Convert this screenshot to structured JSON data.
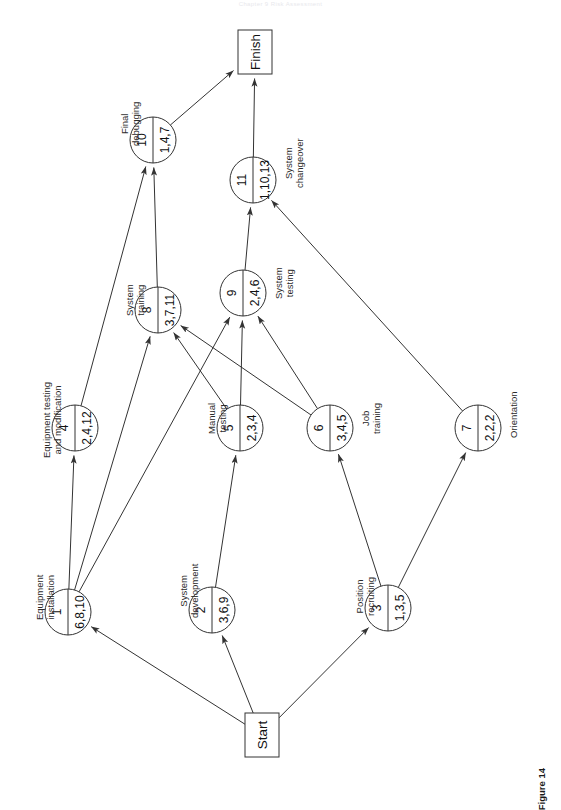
{
  "page": {
    "header_note": "Chapter 9  Risk Assessment",
    "figure_caption": "Figure 14"
  },
  "diagram": {
    "type": "activity-network",
    "orientation": "rotated-90-ccw",
    "terminals": [
      {
        "id": "start",
        "label": "Start",
        "x": 262,
        "y": 735,
        "w": 34,
        "h": 44
      },
      {
        "id": "finish",
        "label": "Finish",
        "x": 255,
        "y": 52,
        "w": 34,
        "h": 44
      }
    ],
    "nodes": [
      {
        "id": 1,
        "num": "1",
        "value": "6,8,10",
        "label": "Equipment\ninstallation",
        "x": 68,
        "y": 612,
        "r": 23,
        "label_dx": -34,
        "label_dy": 8
      },
      {
        "id": 2,
        "num": "2",
        "value": "3,6,9",
        "label": "System\ndevelopment",
        "x": 212,
        "y": 610,
        "r": 23,
        "label_dx": -34,
        "label_dy": 8
      },
      {
        "id": 3,
        "num": "3",
        "value": "1,3,5",
        "label": "Position\nrecruiting",
        "x": 388,
        "y": 608,
        "r": 23,
        "label_dx": -34,
        "label_dy": 8
      },
      {
        "id": 4,
        "num": "4",
        "value": "2,4,12",
        "label": "Equipment testing\nand modification",
        "x": 75,
        "y": 428,
        "r": 23,
        "label_dx": -34,
        "label_dy": 30
      },
      {
        "id": 5,
        "num": "5",
        "value": "2,3,4",
        "label": "Manual\ntesting",
        "x": 240,
        "y": 428,
        "r": 23,
        "label_dx": -34,
        "label_dy": 6
      },
      {
        "id": 6,
        "num": "6",
        "value": "3,4,5",
        "label": "Job\ntraining",
        "x": 330,
        "y": 428,
        "r": 23,
        "label_dx": 30,
        "label_dy": 6
      },
      {
        "id": 7,
        "num": "7",
        "value": "2,2,2",
        "label": "Orientation",
        "x": 478,
        "y": 428,
        "r": 23,
        "label_dx": 30,
        "label_dy": 10
      },
      {
        "id": 8,
        "num": "8",
        "value": "3,7,11",
        "label": "System\ntraining",
        "x": 158,
        "y": 310,
        "r": 23,
        "label_dx": -34,
        "label_dy": 6
      },
      {
        "id": 9,
        "num": "9",
        "value": "2,4,6",
        "label": "System\ntesting",
        "x": 243,
        "y": 293,
        "r": 23,
        "label_dx": 30,
        "label_dy": 6
      },
      {
        "id": 10,
        "num": "10",
        "value": "1,4,7",
        "label": "Final\ndebugging",
        "x": 153,
        "y": 140,
        "r": 23,
        "label_dx": -34,
        "label_dy": 6
      },
      {
        "id": 11,
        "num": "11",
        "value": "1,10,13",
        "label": "System\nchangeover",
        "x": 253,
        "y": 180,
        "r": 23,
        "label_dx": 30,
        "label_dy": 8
      }
    ],
    "edges": [
      {
        "from": "start",
        "to": 1
      },
      {
        "from": "start",
        "to": 2
      },
      {
        "from": "start",
        "to": 3
      },
      {
        "from": 1,
        "to": 4
      },
      {
        "from": 1,
        "to": 8
      },
      {
        "from": 1,
        "to": 9
      },
      {
        "from": 2,
        "to": 5
      },
      {
        "from": 3,
        "to": 6
      },
      {
        "from": 3,
        "to": 7
      },
      {
        "from": 4,
        "to": 10
      },
      {
        "from": 5,
        "to": 8
      },
      {
        "from": 5,
        "to": 9
      },
      {
        "from": 6,
        "to": 8
      },
      {
        "from": 6,
        "to": 9
      },
      {
        "from": 7,
        "to": 11
      },
      {
        "from": 8,
        "to": 10
      },
      {
        "from": 9,
        "to": 11
      },
      {
        "from": 10,
        "to": "finish"
      },
      {
        "from": 11,
        "to": "finish"
      }
    ],
    "style": {
      "stroke": "#333333",
      "fill": "#ffffff",
      "stroke_width": 1
    }
  }
}
